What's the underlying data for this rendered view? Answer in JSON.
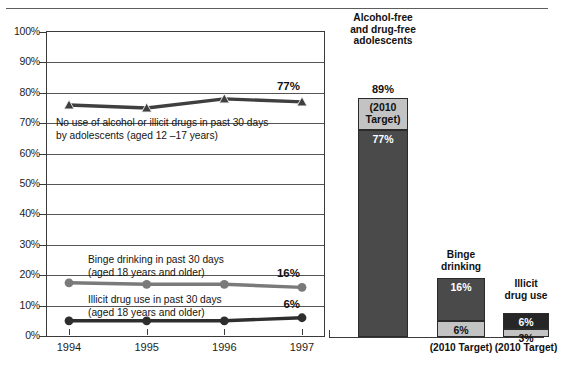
{
  "chart_data": {
    "type": "line",
    "title": "",
    "xlabel": "",
    "ylabel": "",
    "ylim": [
      0,
      100
    ],
    "grid": true,
    "legend": "inline-annotations",
    "x": [
      "1994",
      "1995",
      "1996",
      "1997"
    ],
    "ytick_labels": [
      "100%",
      "90%",
      "80%",
      "70%",
      "60%",
      "50%",
      "40%",
      "30%",
      "20%",
      "10%",
      "0%"
    ],
    "ytick_values": [
      100,
      90,
      80,
      70,
      60,
      50,
      40,
      30,
      20,
      10,
      0
    ],
    "series": [
      {
        "name": "No use of alcohol or illicit drugs in past 30 days by adolescents (aged 12 –17 years)",
        "marker": "triangle",
        "color": "#3f3f3f",
        "values": [
          76,
          75,
          78,
          77
        ],
        "end_label": "77%"
      },
      {
        "name": "Binge drinking in past 30 days (aged 18 years and older)",
        "marker": "circle",
        "color": "#7a7a7a",
        "values": [
          17.5,
          17,
          17,
          16
        ],
        "end_label": "16%"
      },
      {
        "name": "Illicit drug use in past 30 days (aged 18 years and older)",
        "marker": "circle",
        "color": "#2e2e2e",
        "values": [
          5,
          5,
          5,
          6
        ],
        "end_label": "6%"
      }
    ],
    "annotations": [
      {
        "line1": "No use of alcohol or illicit drugs in past 30 days",
        "line2": "by adolescents (aged 12 –17 years)"
      },
      {
        "line1": "Binge drinking in past 30 days",
        "line2": "(aged 18 years and older)"
      },
      {
        "line1": "Illicit drug use in past 30 days",
        "line2": "(aged 18 years and older)"
      }
    ],
    "bars": {
      "type": "bar",
      "ylim": [
        0,
        100
      ],
      "items": [
        {
          "title": "Alcohol-free\nand drug-free\nadolescents",
          "top_value_label": "89%",
          "target_value": 89,
          "current_value": 77,
          "current_label": "77%",
          "target_label": "(2010\nTarget)",
          "footer": "",
          "order": "target-above-current"
        },
        {
          "title": "Binge\ndrinking",
          "top_value_label": "",
          "target_value": 6,
          "current_value": 16,
          "current_label": "16%",
          "target_label": "6%",
          "footer": "(2010 Target)",
          "order": "current-above-target"
        },
        {
          "title": "Illicit\ndrug use",
          "top_value_label": "",
          "target_value": 3,
          "current_value": 6,
          "current_label": "6%",
          "target_label": "3%",
          "footer": "(2010 Target)",
          "order": "current-above-target"
        }
      ]
    },
    "colors": {
      "dark_segment": "#4a4a4a",
      "darkest_segment": "#262626",
      "light_segment": "#c3c3c3",
      "axis": "#3a3a3a",
      "grid": "#555555"
    }
  }
}
